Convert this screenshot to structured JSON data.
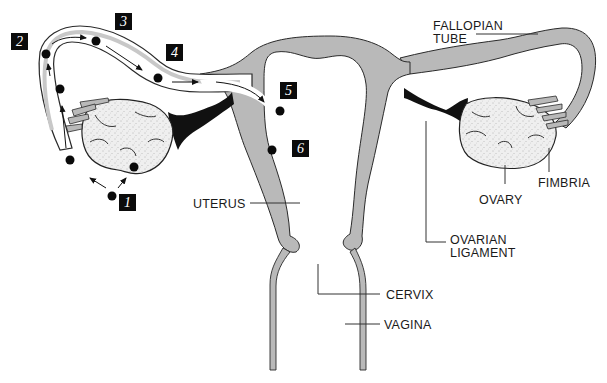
{
  "diagram": {
    "colors": {
      "tissue_fill": "#b9b9b9",
      "outline": "#2a2a2a",
      "ligament": "#111111",
      "ovary_fill": "#eeeeee",
      "background": "#ffffff",
      "step_box": "#0b0b0b"
    },
    "labels": {
      "fallopian_tube": "FALLOPIAN\nTUBE",
      "fallopian_line1": "FALLOPIAN",
      "fallopian_line2": "TUBE",
      "fimbria": "FIMBRIA",
      "ovary": "OVARY",
      "ovarian_ligament_line1": "OVARIAN",
      "ovarian_ligament_line2": "LIGAMENT",
      "uterus": "UTERUS",
      "cervix": "CERVIX",
      "vagina": "VAGINA"
    },
    "steps": [
      {
        "number": "1",
        "x": 119,
        "y": 194
      },
      {
        "number": "2",
        "x": 14,
        "y": 33
      },
      {
        "number": "3",
        "x": 115,
        "y": 14
      },
      {
        "number": "4",
        "x": 166,
        "y": 44
      },
      {
        "number": "5",
        "x": 280,
        "y": 82
      },
      {
        "number": "6",
        "x": 292,
        "y": 140
      }
    ],
    "ovum_positions": [
      {
        "x": 112,
        "y": 196
      },
      {
        "x": 70,
        "y": 160
      },
      {
        "x": 60,
        "y": 89
      },
      {
        "x": 46,
        "y": 54
      },
      {
        "x": 96,
        "y": 41
      },
      {
        "x": 158,
        "y": 78
      },
      {
        "x": 280,
        "y": 111
      },
      {
        "x": 272,
        "y": 150
      },
      {
        "x": 134,
        "y": 167
      }
    ]
  }
}
